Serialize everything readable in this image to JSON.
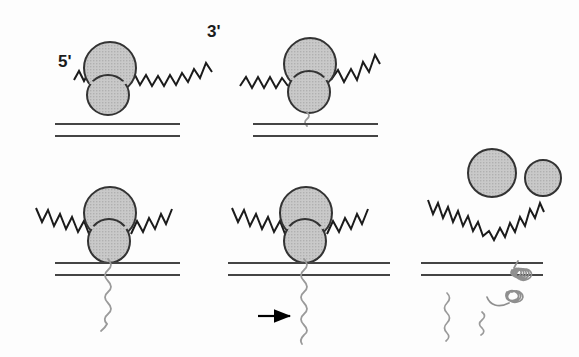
{
  "figure": {
    "domain": "diagram",
    "width": 579,
    "height": 357,
    "background_color": "#fdfdfd"
  },
  "labels": {
    "five_prime": "5'",
    "three_prime": "3'"
  },
  "colors": {
    "ribosome_fill": "#c4c4c4",
    "ribosome_stroke": "#333333",
    "mrna_stroke": "#1b1b1b",
    "membrane_stroke": "#444444",
    "polypeptide_stroke": "#9a9a9a",
    "arrow_stroke": "#000000",
    "label_color": "#1b1b1b",
    "background": "#fdfdfd"
  },
  "geometry": {
    "ribosome_large_lobe_r": 26,
    "ribosome_small_lobe_r": 21,
    "subunit_large_r": 24,
    "subunit_small_r": 18,
    "membrane_line_gap": 12,
    "membrane_stroke_width": 2.2,
    "mrna_stroke_width": 2.0,
    "polypeptide_stroke_width": 1.8
  },
  "panels": [
    {
      "id": "panel-1",
      "name": "ribosome-mrna-binding",
      "stage_index": 1,
      "description": "Ribosome assembled on mRNA above the membrane; 5' and 3' ends of the mRNA are labelled.",
      "ribosome": {
        "cx": 110,
        "cy": 68,
        "state": "assembled",
        "attached_to_membrane": false
      },
      "membrane": {
        "x1": 55,
        "x2": 180,
        "y_top": 124,
        "y_bottom": 136
      },
      "mrna": {
        "left_end": "5'",
        "right_end": "3'",
        "shape": "zigzag"
      },
      "polypeptide": null,
      "arrow": null,
      "labels": [
        "5'",
        "3'"
      ]
    },
    {
      "id": "panel-2",
      "name": "signal-peptide-emerging",
      "stage_index": 2,
      "description": "Ribosome docked at the membrane with a short nascent polypeptide emerging from the small subunit.",
      "ribosome": {
        "cx": 310,
        "cy": 66,
        "state": "assembled",
        "attached_to_membrane": true
      },
      "membrane": {
        "x1": 253,
        "x2": 378,
        "y_top": 124,
        "y_bottom": 136
      },
      "mrna": {
        "shape": "zigzag"
      },
      "polypeptide": {
        "length": "short",
        "crosses_membrane": false
      },
      "arrow": null,
      "labels": []
    },
    {
      "id": "panel-3",
      "name": "chain-translocating",
      "stage_index": 3,
      "description": "Ribosome seated on the membrane; the growing polypeptide chain threads through the membrane into the lumen.",
      "ribosome": {
        "cx": 110,
        "cy": 218,
        "state": "assembled",
        "attached_to_membrane": true
      },
      "membrane": {
        "x1": 55,
        "x2": 180,
        "y_top": 263,
        "y_bottom": 275
      },
      "mrna": {
        "shape": "zigzag"
      },
      "polypeptide": {
        "length": "medium",
        "crosses_membrane": true
      },
      "arrow": null,
      "labels": []
    },
    {
      "id": "panel-4",
      "name": "chain-elongating",
      "stage_index": 4,
      "description": "Elongation continues; an arrow indicates the direction of growth of the translocating chain.",
      "ribosome": {
        "cx": 305,
        "cy": 218,
        "state": "assembled",
        "attached_to_membrane": true
      },
      "membrane": {
        "x1": 228,
        "x2": 390,
        "y_top": 263,
        "y_bottom": 275
      },
      "mrna": {
        "shape": "zigzag"
      },
      "polypeptide": {
        "length": "long",
        "crosses_membrane": true
      },
      "arrow": {
        "x1": 258,
        "x2": 292,
        "y": 316,
        "direction": "right"
      },
      "labels": []
    },
    {
      "id": "panel-5",
      "name": "termination-and-folding",
      "stage_index": 5,
      "description": "Translation terminates: ribosomal subunits dissociate, mRNA is released, and the finished protein folds in the lumen alongside cleaved peptide fragments.",
      "ribosome": {
        "state": "dissociated",
        "subunits": [
          {
            "name": "large-subunit",
            "cx": 492,
            "cy": 173,
            "r": 24
          },
          {
            "name": "small-subunit",
            "cx": 543,
            "cy": 178,
            "r": 18
          }
        ]
      },
      "membrane": {
        "x1": 421,
        "x2": 543,
        "y_top": 263,
        "y_bottom": 275
      },
      "mrna": {
        "shape": "zigzag-valley",
        "released": true
      },
      "polypeptide": {
        "state": "folded-helix",
        "fragments": 2
      },
      "arrow": null,
      "labels": []
    }
  ]
}
